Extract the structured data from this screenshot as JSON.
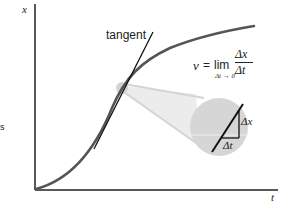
{
  "diagram": {
    "axes": {
      "y_label": "x",
      "x_label": "t"
    },
    "tangent_label": "tangent",
    "side_label": "s",
    "formula": {
      "lhs": "v",
      "eq": "=",
      "op": "lim",
      "numerator": "Δx",
      "denominator": "Δt",
      "subscript": "Δt → 0"
    },
    "magnifier": {
      "dx_label": "Δx",
      "dt_label": "Δt"
    },
    "colors": {
      "curve": "#555555",
      "tangent": "#111111",
      "axes": "#222222",
      "magnifier_fill": "#d6d6d6",
      "magnifier_divider": "#eeeeee"
    }
  }
}
